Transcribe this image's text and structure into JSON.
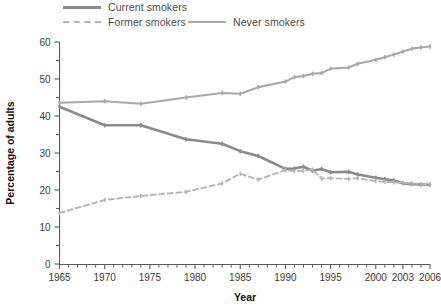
{
  "legend": {
    "entries": [
      {
        "label": "Current smokers",
        "style": "solid-dark",
        "icon": "line-swatch-solid-icon"
      },
      {
        "label": "Former smokers",
        "style": "dashed-light",
        "icon": "line-swatch-dashed-icon"
      },
      {
        "label": "Never smokers",
        "style": "solid-light",
        "icon": "line-swatch-solid-icon"
      }
    ]
  },
  "chart_data": {
    "type": "line",
    "title": "",
    "xlabel": "Year",
    "ylabel": "Percentage of adults",
    "xlim": [
      1965,
      2006
    ],
    "ylim": [
      0,
      60
    ],
    "grid": false,
    "legend_position": "top",
    "y_ticks_major": [
      0,
      10,
      20,
      30,
      40,
      50,
      60
    ],
    "y_ticks_minor": [
      5,
      15,
      25,
      35,
      45,
      55
    ],
    "x_tick_labels": [
      "1965",
      "1970",
      "1975",
      "1980",
      "1985",
      "1990",
      "1995",
      "2000",
      "2003",
      "2006"
    ],
    "x_tick_values": [
      1965,
      1970,
      1975,
      1980,
      1985,
      1990,
      1995,
      2000,
      2003,
      2006
    ],
    "x_minor_step": 1,
    "series": [
      {
        "name": "Current smokers",
        "color": "#8a8a8a",
        "dash": false,
        "x": [
          1965,
          1970,
          1974,
          1979,
          1983,
          1985,
          1987,
          1990,
          1991,
          1992,
          1993,
          1994,
          1995,
          1997,
          1998,
          2000,
          2001,
          2002,
          2003,
          2004,
          2005,
          2006
        ],
        "values": [
          42.5,
          37.5,
          37.5,
          33.7,
          32.5,
          30.5,
          29.2,
          25.7,
          25.8,
          26.3,
          25.2,
          25.7,
          24.8,
          24.9,
          24.2,
          23.3,
          22.9,
          22.6,
          21.8,
          21.6,
          21.5,
          21.4
        ]
      },
      {
        "name": "Former smokers",
        "color": "#b4b4b4",
        "dash": true,
        "x": [
          1965,
          1970,
          1974,
          1979,
          1983,
          1985,
          1987,
          1990,
          1991,
          1992,
          1993,
          1994,
          1995,
          1997,
          1998,
          2000,
          2001,
          2002,
          2003,
          2004,
          2005,
          2006
        ],
        "values": [
          13.8,
          17.3,
          18.4,
          19.5,
          21.8,
          24.4,
          22.8,
          25.4,
          25.1,
          25.2,
          25.5,
          23.1,
          23.2,
          23.0,
          23.2,
          22.4,
          22.2,
          22.1,
          21.9,
          21.8,
          21.6,
          21.4
        ]
      },
      {
        "name": "Never smokers",
        "color": "#a8a8a8",
        "dash": false,
        "x": [
          1965,
          1970,
          1974,
          1979,
          1983,
          1985,
          1987,
          1990,
          1991,
          1992,
          1993,
          1994,
          1995,
          1997,
          1998,
          2000,
          2001,
          2002,
          2003,
          2004,
          2005,
          2006
        ],
        "values": [
          43.6,
          44.0,
          43.3,
          45.0,
          46.2,
          46.0,
          47.8,
          49.3,
          50.5,
          50.8,
          51.4,
          51.6,
          52.8,
          53.1,
          54.1,
          55.2,
          55.9,
          56.6,
          57.4,
          58.2,
          58.5,
          58.8
        ]
      }
    ]
  }
}
